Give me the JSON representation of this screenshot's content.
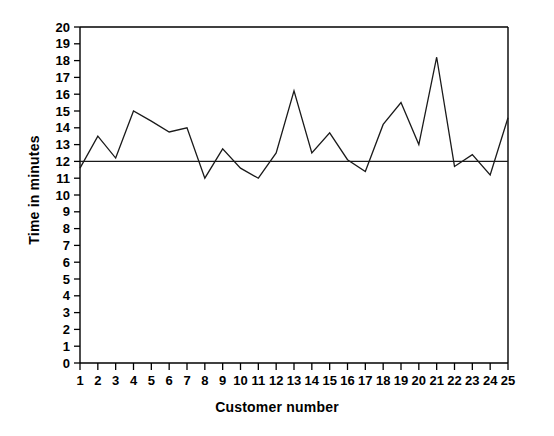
{
  "chart_data": {
    "type": "line",
    "title": "",
    "xlabel": "Customer number",
    "ylabel": "Time in minutes",
    "x": [
      1,
      2,
      3,
      4,
      5,
      6,
      7,
      8,
      9,
      10,
      11,
      12,
      13,
      14,
      15,
      16,
      17,
      18,
      19,
      20,
      21,
      22,
      23,
      24,
      25
    ],
    "xtick_labels": [
      "1",
      "2",
      "3",
      "4",
      "5",
      "6",
      "7",
      "8",
      "9",
      "10",
      "11",
      "12",
      "13",
      "14",
      "15",
      "16",
      "17",
      "18",
      "19",
      "20",
      "21",
      "22",
      "23",
      "24",
      "25"
    ],
    "ytick_labels": [
      "0",
      "1",
      "2",
      "3",
      "4",
      "5",
      "6",
      "7",
      "8",
      "9",
      "10",
      "11",
      "12",
      "13",
      "14",
      "15",
      "16",
      "17",
      "18",
      "19",
      "20"
    ],
    "values": [
      11.6,
      13.5,
      12.2,
      15.0,
      14.4,
      13.75,
      14.0,
      11.0,
      12.75,
      11.6,
      11.0,
      12.5,
      16.2,
      12.5,
      13.7,
      12.1,
      11.4,
      14.2,
      15.5,
      13.0,
      18.2,
      11.7,
      12.4,
      11.2,
      14.6
    ],
    "series": [
      {
        "name": "Time in minutes",
        "values": [
          11.6,
          13.5,
          12.2,
          15.0,
          14.4,
          13.75,
          14.0,
          11.0,
          12.75,
          11.6,
          11.0,
          12.5,
          16.2,
          12.5,
          13.7,
          12.1,
          11.4,
          14.2,
          15.5,
          13.0,
          18.2,
          11.7,
          12.4,
          11.2,
          14.6
        ]
      }
    ],
    "reference_line": {
      "label": "center line",
      "value": 12
    },
    "ylim": [
      0,
      20
    ],
    "xlim": [
      1,
      25
    ],
    "grid": false,
    "legend": "none",
    "line_color": "#1a1a1a",
    "axis_color": "#000000",
    "background_color": "#ffffff"
  }
}
